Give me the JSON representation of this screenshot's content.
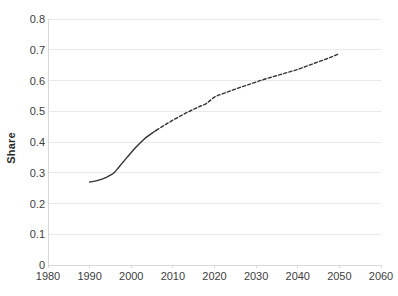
{
  "chart_data": {
    "type": "line",
    "title": "",
    "subtitle": "",
    "xlabel": "",
    "ylabel": "Share",
    "xlim": [
      1980,
      2060
    ],
    "ylim": [
      0,
      0.8
    ],
    "grid": "horizontal",
    "legend": "none",
    "x_ticks": [
      1980,
      1990,
      2000,
      2010,
      2020,
      2030,
      2040,
      2050,
      2060
    ],
    "x_tick_labels": [
      "1980",
      "1990",
      "2000",
      "2010",
      "2020",
      "2030",
      "2040",
      "2050",
      "2060"
    ],
    "y_ticks": [
      0,
      0.1,
      0.2,
      0.3,
      0.4,
      0.5,
      0.6,
      0.7,
      0.8
    ],
    "y_tick_labels": [
      "0",
      "0.1",
      "0.2",
      "0.3",
      "0.4",
      "0.5",
      "0.6",
      "0.7",
      "0.8"
    ],
    "line_color": "#333333",
    "grid_color": "#e9e9e9",
    "axis_color": "#d9d9d9",
    "series": [
      {
        "name": "Share (historical)",
        "style": "solid",
        "color": "#333333",
        "x": [
          1990,
          1991,
          1992,
          1993,
          1994,
          1995,
          1996,
          1997,
          1998,
          1999,
          2000,
          2001,
          2002,
          2003,
          2004,
          2005,
          2006
        ],
        "values": [
          0.27,
          0.272,
          0.275,
          0.279,
          0.285,
          0.292,
          0.302,
          0.318,
          0.334,
          0.35,
          0.366,
          0.381,
          0.395,
          0.408,
          0.419,
          0.429,
          0.438
        ]
      },
      {
        "name": "Share (projected)",
        "style": "dashed",
        "color": "#333333",
        "x": [
          2006,
          2008,
          2010,
          2012,
          2014,
          2016,
          2018,
          2020,
          2022,
          2024,
          2026,
          2028,
          2030,
          2032,
          2034,
          2036,
          2038,
          2040,
          2042,
          2044,
          2046,
          2048,
          2050
        ],
        "values": [
          0.438,
          0.455,
          0.471,
          0.486,
          0.5,
          0.513,
          0.525,
          0.546,
          0.557,
          0.567,
          0.577,
          0.586,
          0.595,
          0.604,
          0.612,
          0.62,
          0.628,
          0.636,
          0.646,
          0.656,
          0.666,
          0.676,
          0.688
        ]
      }
    ]
  },
  "plot_geometry": {
    "left": 48,
    "right": 381,
    "top": 19,
    "bottom": 265
  }
}
